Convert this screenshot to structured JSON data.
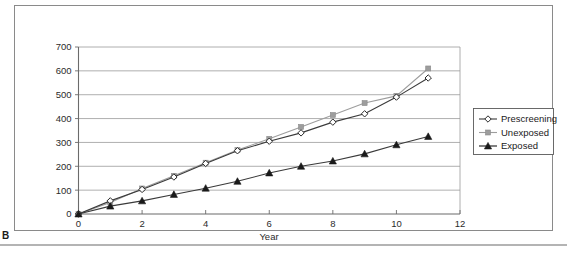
{
  "panel": {
    "letter": "B"
  },
  "chart_data": {
    "type": "line",
    "title": "",
    "subtitle": "",
    "xlabel": "Year",
    "ylabel": "",
    "x": [
      0,
      1,
      2,
      3,
      4,
      5,
      6,
      7,
      8,
      9,
      10,
      11
    ],
    "xlim": [
      0,
      12
    ],
    "ylim": [
      0,
      700
    ],
    "xticks": [
      0,
      2,
      4,
      6,
      8,
      10,
      12
    ],
    "xtick_labels": [
      "0",
      "2",
      "4",
      "6",
      "8",
      "10",
      "12"
    ],
    "yticks": [
      0,
      100,
      200,
      300,
      400,
      500,
      600,
      700
    ],
    "ytick_labels": [
      "0",
      "100",
      "200",
      "300",
      "400",
      "500",
      "600",
      "700"
    ],
    "grid": "horizontal",
    "legend_position": "right",
    "series": [
      {
        "name": "Prescreening",
        "marker": "diamond-open",
        "color": "#3a3a3a",
        "values": [
          0,
          55,
          103,
          155,
          212,
          265,
          305,
          340,
          385,
          420,
          490,
          570
        ]
      },
      {
        "name": "Unexposed",
        "marker": "square-filled",
        "color": "#9d9d9d",
        "values": [
          0,
          48,
          107,
          160,
          215,
          268,
          315,
          365,
          415,
          465,
          495,
          610
        ]
      },
      {
        "name": "Exposed",
        "marker": "triangle-filled",
        "color": "#1a1a1a",
        "values": [
          0,
          33,
          55,
          82,
          108,
          137,
          172,
          200,
          222,
          252,
          290,
          325
        ]
      }
    ]
  },
  "legend": {
    "items": [
      {
        "label": "Prescreening"
      },
      {
        "label": "Unexposed"
      },
      {
        "label": "Exposed"
      }
    ]
  }
}
